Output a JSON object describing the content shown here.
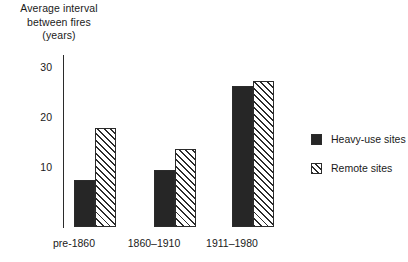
{
  "chart_data": {
    "type": "bar",
    "title": "",
    "ylabel": "Average interval between fires (years)",
    "ylabel_lines": [
      "Average interval",
      "between fires",
      "(years)"
    ],
    "xlabel": "",
    "categories": [
      "pre-1860",
      "1860–1910",
      "1911–1980"
    ],
    "series": [
      {
        "name": "Heavy-use sites",
        "values": [
          9,
          11,
          27
        ]
      },
      {
        "name": "Remote sites",
        "values": [
          19,
          15,
          28
        ]
      }
    ],
    "ylim": [
      0,
      33
    ],
    "yticks": [
      10,
      20,
      30
    ],
    "ytick_labels": [
      "10",
      "20",
      "30"
    ],
    "grid": false,
    "legend_position": "right"
  },
  "legend": {
    "items": [
      {
        "label": "Heavy-use sites",
        "pattern": "solid-black",
        "color": "#262626"
      },
      {
        "label": "Remote sites",
        "pattern": "diagonal-hatch",
        "color": "#2b2b2b"
      }
    ]
  },
  "colors": {
    "heavy_use": "#262626",
    "remote_hatch": "#2b2b2b",
    "background": "#ffffff",
    "axis": "#2b2b2b",
    "text": "#1a1a1a"
  }
}
